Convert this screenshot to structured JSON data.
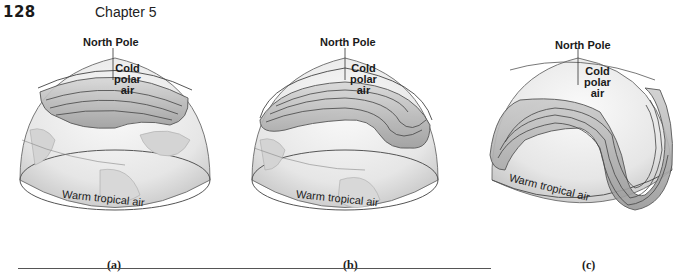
{
  "header": {
    "page_number": "128",
    "chapter": "Chapter 5"
  },
  "panels": [
    {
      "id": "a",
      "north_pole_label": "North Pole",
      "cold_label_lines": [
        "Cold",
        "polar",
        "air"
      ],
      "warm_label": "Warm tropical air",
      "caption": "(a)",
      "description": "Jet stream flowing nearly straight west-to-east around the pole"
    },
    {
      "id": "b",
      "north_pole_label": "North Pole",
      "cold_label_lines": [
        "Cold",
        "polar",
        "air"
      ],
      "warm_label": "Warm tropical air",
      "caption": "(b)",
      "description": "Jet stream developing a wave"
    },
    {
      "id": "c",
      "north_pole_label": "North Pole",
      "cold_label_lines": [
        "Cold",
        "polar",
        "air"
      ],
      "warm_label": "Warm tropical air",
      "caption": "(c)",
      "description": "Jet stream with a deep meander / trough extending south"
    }
  ],
  "colors": {
    "globe_fill": "#eeeeee",
    "globe_edge": "#888888",
    "band_fill": "#b5b5b5",
    "band_edge": "#555555",
    "land": "#dcdcdc",
    "text": "#1a1a1a"
  }
}
